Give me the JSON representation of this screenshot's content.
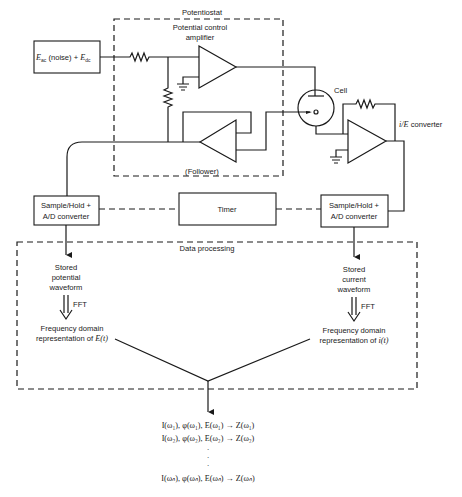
{
  "diagram": {
    "source_box": {
      "label_main": "E",
      "sub_ac": "ac",
      "mid": " (noise) + ",
      "label_main2": "E",
      "sub_dc": "dc"
    },
    "potentiostat": {
      "title": "Potentiostat",
      "control_amp_line1": "Potential control",
      "control_amp_line2": "amplifier",
      "follower_label": "(Follower)"
    },
    "cell_label": "Cell",
    "ie_converter": {
      "italic": "i/E",
      "label": " converter"
    },
    "sample_hold_left": {
      "line1": "Sample/Hold +",
      "line2": "A/D converter"
    },
    "timer": "Timer",
    "sample_hold_right": {
      "line1": "Sample/Hold +",
      "line2": "A/D converter"
    },
    "data_processing": {
      "title": "Data processing",
      "left": {
        "stored_1": "Stored",
        "stored_2": "potential",
        "stored_3": "waveform",
        "fft": "FFT",
        "freq_1": "Frequency domain",
        "freq_2": "representation of ",
        "freq_var": "E(t)"
      },
      "right": {
        "stored_1": "Stored",
        "stored_2": "current",
        "stored_3": "waveform",
        "fft": "FFT",
        "freq_1": "Frequency domain",
        "freq_2": "representation of ",
        "freq_var": "i(t)"
      }
    },
    "results": [
      "I(ω₁), φ(ω₁), E(ω₁) → Z(ω₁)",
      "I(ω₂), φ(ω₂), E(ω₂) → Z(ω₂)",
      "·",
      "·",
      "·",
      "I(ωₙ), φ(ωₙ), E(ωₙ) → Z(ωₙ)"
    ]
  }
}
